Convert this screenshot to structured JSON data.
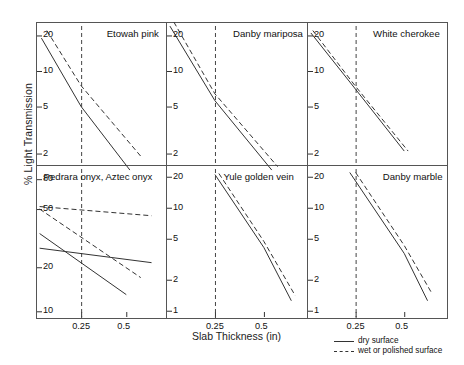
{
  "figure": {
    "ylabel": "% Light Transmission",
    "xlabel": "Slab Thickness (in)",
    "caption": ""
  },
  "legend": {
    "position": "bottom-right",
    "entries": [
      {
        "label": "dry surface",
        "style": "solid"
      },
      {
        "label": "wet or polished surface",
        "style": "dashed"
      }
    ]
  },
  "chart_data": {
    "type": "line",
    "xlabel": "Slab Thickness (in)",
    "ylabel": "% Light Transmission",
    "xscale": "linear",
    "yscale": "log",
    "xlim": [
      0.0,
      0.72
    ],
    "xticks": [
      0.25,
      0.5
    ],
    "xticklabels": [
      "0.25",
      "0.5"
    ],
    "grid": false,
    "reference_line_x": 0.25,
    "panels": [
      {
        "name": "etowah-pink",
        "title": "Etowah pink",
        "row": 0,
        "col": 0,
        "ylim": [
          1.6,
          26
        ],
        "yticks": [
          20,
          10,
          5,
          2
        ],
        "yticklabels": [
          "20",
          "10",
          "5",
          "2"
        ],
        "series": [
          {
            "name": "dry surface",
            "style": "solid",
            "x": [
              0.03,
              0.25,
              0.52
            ],
            "y": [
              19.0,
              5.0,
              1.45
            ]
          },
          {
            "name": "wet or polished surface",
            "style": "dashed",
            "x": [
              0.06,
              0.25,
              0.58
            ],
            "y": [
              22.0,
              7.5,
              1.9
            ]
          }
        ]
      },
      {
        "name": "danby-mariposa",
        "title": "Danby mariposa",
        "row": 0,
        "col": 1,
        "ylim": [
          1.6,
          26
        ],
        "yticks": [
          20,
          10,
          5,
          2
        ],
        "yticklabels": [
          "20",
          "10",
          "5",
          "2"
        ],
        "series": [
          {
            "name": "dry surface",
            "style": "solid",
            "x": [
              0.02,
              0.25,
              0.54
            ],
            "y": [
              24.0,
              5.6,
              1.45
            ]
          },
          {
            "name": "wet or polished surface",
            "style": "dashed",
            "x": [
              0.04,
              0.25,
              0.57
            ],
            "y": [
              26.0,
              6.4,
              1.55
            ]
          }
        ]
      },
      {
        "name": "white-cherokee",
        "title": "White cherokee",
        "row": 0,
        "col": 2,
        "ylim": [
          1.6,
          26
        ],
        "yticks": [
          20,
          10,
          5,
          2
        ],
        "yticklabels": [
          "20",
          "10",
          "5",
          "2"
        ],
        "series": [
          {
            "name": "dry surface",
            "style": "solid",
            "x": [
              0.02,
              0.25,
              0.5
            ],
            "y": [
              21.0,
              7.0,
              2.1
            ]
          },
          {
            "name": "wet or polished surface",
            "style": "dashed",
            "x": [
              0.03,
              0.25,
              0.52
            ],
            "y": [
              22.0,
              7.4,
              2.1
            ]
          }
        ]
      },
      {
        "name": "pedrara-aztec-onyx",
        "title": "Pedrara onyx, Aztec onyx",
        "row": 1,
        "col": 0,
        "ylim": [
          9,
          100
        ],
        "yticks": [
          80,
          50,
          20,
          10
        ],
        "yticklabels": [
          "80",
          "50",
          "20",
          "10"
        ],
        "series": [
          {
            "name": "wet or polished surface (flat)",
            "style": "dashed",
            "x": [
              0.02,
              0.64
            ],
            "y": [
              52.0,
              45.0
            ]
          },
          {
            "name": "wet or polished surface (steep)",
            "style": "dashed",
            "x": [
              0.02,
              0.58
            ],
            "y": [
              50.0,
              17.0
            ]
          },
          {
            "name": "dry surface (flat)",
            "style": "solid",
            "x": [
              0.02,
              0.64
            ],
            "y": [
              27.0,
              21.5
            ]
          },
          {
            "name": "dry surface (steep)",
            "style": "solid",
            "x": [
              0.02,
              0.5
            ],
            "y": [
              34.0,
              13.0
            ]
          }
        ]
      },
      {
        "name": "yule-golden-vein",
        "title": "Yule golden vein",
        "row": 1,
        "col": 1,
        "ylim": [
          0.85,
          26
        ],
        "yticks": [
          20,
          10,
          5,
          2,
          1
        ],
        "yticklabels": [
          "20",
          "10",
          "5",
          "2",
          "1"
        ],
        "series": [
          {
            "name": "dry surface",
            "style": "solid",
            "x": [
              0.25,
              0.5,
              0.64
            ],
            "y": [
              21.0,
              4.1,
              1.25
            ]
          },
          {
            "name": "wet or polished surface",
            "style": "dashed",
            "x": [
              0.27,
              0.5,
              0.66
            ],
            "y": [
              21.5,
              4.7,
              1.4
            ]
          }
        ]
      },
      {
        "name": "danby-marble",
        "title": "Danby marble",
        "row": 1,
        "col": 2,
        "ylim": [
          0.85,
          26
        ],
        "yticks": [
          20,
          10,
          5,
          2,
          1
        ],
        "yticklabels": [
          "20",
          "10",
          "5",
          "2",
          "1"
        ],
        "series": [
          {
            "name": "dry surface",
            "style": "solid",
            "x": [
              0.22,
              0.5,
              0.62
            ],
            "y": [
              22.0,
              3.6,
              1.25
            ]
          },
          {
            "name": "wet or polished surface",
            "style": "dashed",
            "x": [
              0.25,
              0.5,
              0.64
            ],
            "y": [
              22.0,
              4.3,
              1.5
            ]
          }
        ]
      }
    ]
  }
}
